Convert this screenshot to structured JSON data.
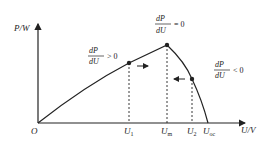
{
  "diagram": {
    "y_axis_label": "P/W",
    "x_axis_label": "U/V",
    "origin_label": "O",
    "x_ticks": [
      {
        "label": "U",
        "sub": "1"
      },
      {
        "label": "U",
        "sub": "m"
      },
      {
        "label": "U",
        "sub": "2"
      },
      {
        "label": "U",
        "sub": "oc"
      }
    ],
    "annotations": {
      "left": {
        "num": "dP",
        "den": "dU",
        "rel": "> 0"
      },
      "peak": {
        "num": "dP",
        "den": "dU",
        "rel": "= 0"
      },
      "right": {
        "num": "dP",
        "den": "dU",
        "rel": "< 0"
      }
    },
    "colors": {
      "line": "#222222",
      "background": "#ffffff"
    }
  }
}
